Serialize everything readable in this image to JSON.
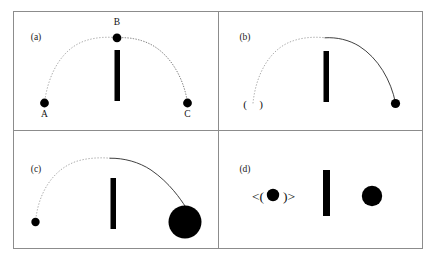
{
  "figure": {
    "background_color": "#ffffff",
    "ink_color": "#000000",
    "border_color": "#8c8c8c",
    "trajectory_solid_color": "#2a2a2a",
    "trajectory_dotted_color": "#6f6f6f",
    "width": 436,
    "height": 265
  },
  "panels": [
    {
      "id": "panel-a",
      "label": "(a)",
      "label_x": 36,
      "label_y": 40,
      "description": "Arc from point A up through apex B and down to point C, with a vertical occluder bar at the center.",
      "occluder": {
        "x": 114.5,
        "y": 50,
        "width": 5.5,
        "height": 51
      },
      "trajectory": {
        "type": "arc",
        "dotted_path": "M 44.5,103 C 48,74 62,48 86,40.5 C 96,37.3 107,36.6 117,37.8",
        "solid_path": "M 117,37.8 C 128,37 140,39 150,44 C 170,54 184,78 187.5,103"
      },
      "points": [
        {
          "name": "A",
          "x": 44.5,
          "y": 103,
          "r": 4.4,
          "label": "A",
          "label_x": 44.5,
          "label_y": 117
        },
        {
          "name": "B",
          "x": 117,
          "y": 37.8,
          "r": 4.4,
          "label": "B",
          "label_x": 117,
          "label_y": 25
        },
        {
          "name": "C",
          "x": 187.5,
          "y": 103,
          "r": 4.4,
          "label": "C",
          "label_x": 187.5,
          "label_y": 117
        }
      ]
    },
    {
      "id": "panel-b",
      "label": "(b)",
      "label_x": 245,
      "label_y": 40,
      "description": "Arc starting at a parenthesized empty position marker on the left, rising over the occluder and ending at a small ball on the right.",
      "occluder": {
        "x": 323.5,
        "y": 51,
        "width": 5.5,
        "height": 51
      },
      "trajectory": {
        "type": "arc",
        "dotted_path": "M 253,103 C 256,74 270,48 294,40.5 C 304,37.3 315,36.6 325,37.8",
        "solid_path": "M 325,37.8 C 337,37 349,40 359,46 C 378,58 391,80 395.5,103"
      },
      "empty_marker": {
        "left_paren": "(",
        "right_paren": ")",
        "x": 253,
        "y": 104,
        "font_size": 11,
        "gap": 8
      },
      "points": [
        {
          "name": "ball-right",
          "x": 395.5,
          "y": 103.5,
          "r": 4.6
        }
      ]
    },
    {
      "id": "panel-c",
      "label": "(c)",
      "label_x": 36,
      "label_y": 172,
      "description": "Arc starting at a small ball on the left, rising over the occluder and ending at a much larger ball on the lower right.",
      "occluder": {
        "x": 110.5,
        "y": 178,
        "width": 5.5,
        "height": 51
      },
      "trajectory": {
        "type": "arc",
        "dotted_path": "M 35.5,222 C 38,194 52,170 76,161.5 C 87,158 99,157.3 110,158.2",
        "solid_path": "M 110,158.2 C 124,158 139,162 151,170 C 170,183 181,200 185,206"
      },
      "points": [
        {
          "name": "ball-small-left",
          "x": 35.5,
          "y": 222,
          "r": 4.2
        },
        {
          "name": "ball-large-right",
          "x": 185,
          "y": 222,
          "r": 16.5
        }
      ]
    },
    {
      "id": "panel-d",
      "label": "(d)",
      "label_x": 245,
      "label_y": 172,
      "description": "No trajectory. A bracketed-and-parenthesized ball glyph on the left, a vertical occluder bar, and a medium ball on the right.",
      "occluder": {
        "x": 323,
        "y": 170,
        "width": 7,
        "height": 46
      },
      "bracket_glyph": {
        "left": "<(",
        "right": ")>",
        "x": 273,
        "y": 196,
        "font_size": 13.5,
        "ball_r": 6.2,
        "ball_x": 273,
        "ball_y": 195
      },
      "points": [
        {
          "name": "ball-right",
          "x": 372,
          "y": 196,
          "r": 10.2
        }
      ]
    }
  ],
  "frame": {
    "outer": {
      "x": 13,
      "y": 11,
      "width": 410,
      "height": 238
    },
    "vertical_divider_x": 218,
    "horizontal_divider_y": 130
  }
}
